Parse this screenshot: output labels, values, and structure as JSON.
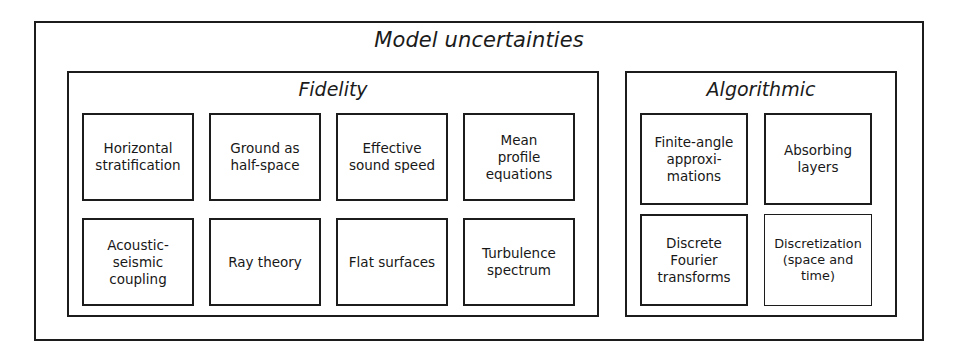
{
  "figure": {
    "title": "Model uncertainties",
    "groups": [
      {
        "id": "fidelity",
        "title": "Fidelity",
        "rows": [
          [
            {
              "label": "Horizontal\nstratification"
            },
            {
              "label": "Ground as\nhalf-space"
            },
            {
              "label": "Effective\nsound speed"
            },
            {
              "label": "Mean\nprofile\nequations"
            }
          ],
          [
            {
              "label": "Acoustic-\nseismic\ncoupling"
            },
            {
              "label": "Ray theory"
            },
            {
              "label": "Flat surfaces"
            },
            {
              "label": "Turbulence\nspectrum"
            }
          ]
        ]
      },
      {
        "id": "algorithmic",
        "title": "Algorithmic",
        "rows": [
          [
            {
              "label": "Finite-angle\napproxi-\nmations"
            },
            {
              "label": "Absorbing\nlayers"
            }
          ],
          [
            {
              "label": "Discrete\nFourier\ntransforms"
            },
            {
              "label": "Discretization\n(space and\ntime)"
            }
          ]
        ]
      }
    ]
  },
  "colors": {
    "stroke": "#1c1c1c",
    "background": "#ffffff",
    "text": "#181818"
  }
}
